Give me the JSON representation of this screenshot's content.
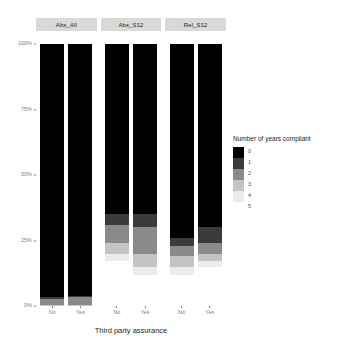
{
  "axis": {
    "x_title": "Third party assurance",
    "y_ticks": [
      "100%",
      "75%",
      "50%",
      "25%",
      "0%"
    ],
    "x_ticks": [
      "No",
      "Yes"
    ]
  },
  "legend": {
    "title": "Number of years compliant",
    "items": [
      {
        "label": "0",
        "color": "#000000"
      },
      {
        "label": "1",
        "color": "#3b3b3b"
      },
      {
        "label": "2",
        "color": "#8a8a8a"
      },
      {
        "label": "3",
        "color": "#c4c4c4"
      },
      {
        "label": "4",
        "color": "#ebebeb"
      },
      {
        "label": "5",
        "color": "#ffffff"
      }
    ]
  },
  "facets": [
    {
      "label": "Abs_All"
    },
    {
      "label": "Abs_S12"
    },
    {
      "label": "Rel_S12"
    }
  ],
  "chart_data": {
    "type": "bar",
    "stacked": true,
    "normalized": true,
    "title": "",
    "xlabel": "Third party assurance",
    "ylabel": "",
    "ylim": [
      0,
      100
    ],
    "ytick_labels": [
      "0%",
      "25%",
      "50%",
      "75%",
      "100%"
    ],
    "ytick_values": [
      0,
      25,
      50,
      75,
      100
    ],
    "grid": false,
    "legend_title": "Number of years compliant",
    "legend_position": "right",
    "facet_variable": "metric",
    "facets": [
      "Abs_All",
      "Abs_S12",
      "Rel_S12"
    ],
    "categories": [
      "No",
      "Yes"
    ],
    "series": [
      {
        "name": "0",
        "color": "#000000"
      },
      {
        "name": "1",
        "color": "#3b3b3b"
      },
      {
        "name": "2",
        "color": "#8a8a8a"
      },
      {
        "name": "3",
        "color": "#c4c4c4"
      },
      {
        "name": "4",
        "color": "#ebebeb"
      },
      {
        "name": "5",
        "color": "#ffffff"
      }
    ],
    "panels": [
      {
        "facet": "Abs_All",
        "bars": [
          {
            "category": "No",
            "values": [
              96.5,
              1.0,
              2.0,
              0.5,
              0.0,
              0.0
            ]
          },
          {
            "category": "Yes",
            "values": [
              96.0,
              0.5,
              3.0,
              0.5,
              0.0,
              0.0
            ]
          }
        ]
      },
      {
        "facet": "Abs_S12",
        "bars": [
          {
            "category": "No",
            "values": [
              65.0,
              4.0,
              7.0,
              4.0,
              3.0,
              17.0
            ]
          },
          {
            "category": "Yes",
            "values": [
              65.0,
              5.0,
              10.0,
              5.0,
              3.0,
              12.0
            ]
          }
        ]
      },
      {
        "facet": "Rel_S12",
        "bars": [
          {
            "category": "No",
            "values": [
              74.0,
              3.0,
              4.0,
              4.0,
              3.0,
              12.0
            ]
          },
          {
            "category": "Yes",
            "values": [
              70.0,
              6.0,
              4.0,
              3.0,
              2.0,
              15.0
            ]
          }
        ]
      }
    ]
  }
}
